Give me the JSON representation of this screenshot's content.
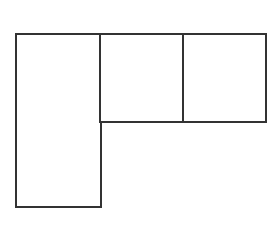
{
  "diagram": {
    "type": "rectangular-layout",
    "stroke_color": "#333333",
    "background": "#ffffff",
    "boxes": [
      {
        "id": "left-tall",
        "x": 15,
        "y": 33,
        "w": 87,
        "h": 175
      },
      {
        "id": "top-middle",
        "x": 99,
        "y": 33,
        "w": 86,
        "h": 90
      },
      {
        "id": "top-right",
        "x": 182,
        "y": 33,
        "w": 85,
        "h": 90
      }
    ]
  }
}
